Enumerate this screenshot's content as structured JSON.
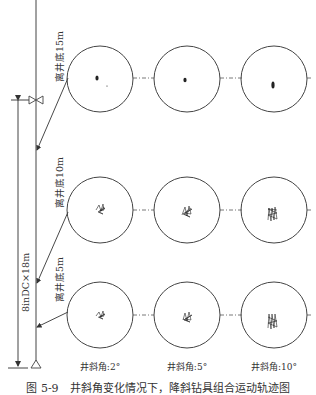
{
  "figure": {
    "caption": "图 5-9　井斜角变化情况下，降斜钻具组合运动轨迹图",
    "colors": {
      "line": "#333333",
      "background": "#ffffff"
    },
    "left_labels": {
      "row1": "离井底15m",
      "row2": "离井底10m",
      "row3": "离井底5m",
      "dimension": "8inDC×18m"
    },
    "columns": [
      {
        "label": "井斜角:2°"
      },
      {
        "label": "井斜角:5°"
      },
      {
        "label": "井斜角:10°"
      }
    ],
    "rows": [
      {
        "distance_from_bottom": "离井底15m"
      },
      {
        "distance_from_bottom": "离井底10m"
      },
      {
        "distance_from_bottom": "离井底5m"
      }
    ],
    "symbols": [
      "valve-symbol",
      "support-triangle",
      "dimension-arrow"
    ]
  }
}
